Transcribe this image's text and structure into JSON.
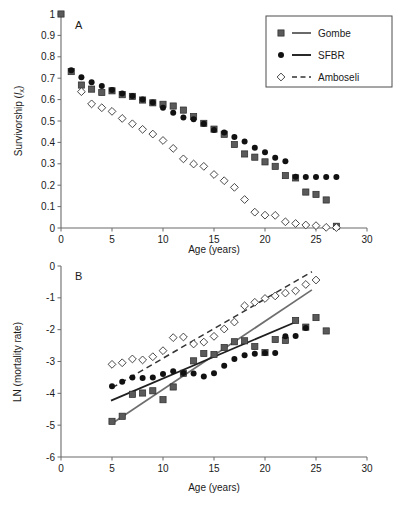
{
  "figure": {
    "background": "#ffffff",
    "panel_a_letter": "A",
    "panel_b_letter": "B"
  },
  "legend": {
    "position": "top-right of panel A",
    "border_color": "#4d4d4d",
    "entries": [
      {
        "label": "Gombe",
        "marker": "filled-square",
        "line": "solid",
        "color": "#5a5a5a"
      },
      {
        "label": "SFBR",
        "marker": "filled-circle",
        "line": "solid",
        "color": "#111111"
      },
      {
        "label": "Amboseli",
        "marker": "open-diamond",
        "line": "dashed",
        "color": "#333333"
      }
    ]
  },
  "chart_data": [
    {
      "type": "scatter",
      "panel": "A",
      "title": "",
      "xlabel": "Age (years)",
      "ylabel": "Survivorship (lx)",
      "ylabel_parts": {
        "main": "Survivorship (",
        "italic": "l",
        "sub": "x",
        "close": ")"
      },
      "xlim": [
        0,
        30
      ],
      "ylim": [
        0,
        1
      ],
      "xticks": [
        0,
        5,
        10,
        15,
        20,
        25,
        30
      ],
      "yticks": [
        0,
        0.1,
        0.2,
        0.3,
        0.4,
        0.5,
        0.6,
        0.7,
        0.8,
        0.9,
        1
      ],
      "ytick_labels": [
        "0",
        "0.1",
        "0.2",
        "0.3",
        "0.4",
        "0.5",
        "0.6",
        "0.7",
        "0.8",
        "0.9",
        "1"
      ],
      "grid": false,
      "legend_position": "upper right",
      "series": [
        {
          "name": "Gombe",
          "marker": "filled-square",
          "color": "#5a5a5a",
          "x": [
            0,
            1,
            2,
            3,
            4,
            5,
            6,
            7,
            8,
            9,
            10,
            11,
            12,
            13,
            14,
            15,
            16,
            17,
            18,
            19,
            20,
            21,
            22,
            23,
            24,
            25,
            26,
            27
          ],
          "values": [
            1.0,
            0.731,
            0.668,
            0.649,
            0.633,
            0.641,
            0.623,
            0.615,
            0.598,
            0.585,
            0.578,
            0.57,
            0.551,
            0.521,
            0.489,
            0.462,
            0.438,
            0.39,
            0.346,
            0.331,
            0.309,
            0.288,
            0.245,
            0.234,
            0.168,
            0.157,
            0.131,
            0.008
          ]
        },
        {
          "name": "SFBR",
          "marker": "filled-circle",
          "color": "#111111",
          "x": [
            1,
            2,
            3,
            4,
            5,
            6,
            7,
            8,
            9,
            10,
            11,
            12,
            13,
            14,
            15,
            16,
            17,
            18,
            19,
            20,
            21,
            22,
            23,
            24,
            25,
            26,
            27
          ],
          "values": [
            0.737,
            0.705,
            0.681,
            0.664,
            0.645,
            0.628,
            0.617,
            0.6,
            0.587,
            0.562,
            0.538,
            0.516,
            0.508,
            0.487,
            0.458,
            0.446,
            0.425,
            0.404,
            0.375,
            0.354,
            0.328,
            0.312,
            0.239,
            0.238,
            0.238,
            0.238,
            0.238
          ]
        },
        {
          "name": "Amboseli",
          "marker": "open-diamond",
          "color": "#333333",
          "x": [
            2,
            3,
            4,
            5,
            6,
            7,
            8,
            9,
            10,
            11,
            12,
            13,
            14,
            15,
            16,
            17,
            18,
            19,
            20,
            21,
            22,
            23,
            24,
            25,
            26,
            27
          ],
          "values": [
            0.637,
            0.58,
            0.562,
            0.545,
            0.512,
            0.487,
            0.461,
            0.439,
            0.409,
            0.372,
            0.323,
            0.299,
            0.288,
            0.25,
            0.221,
            0.19,
            0.133,
            0.074,
            0.06,
            0.059,
            0.029,
            0.021,
            0.014,
            0.011,
            0.003,
            0.002
          ]
        }
      ]
    },
    {
      "type": "scatter",
      "panel": "B",
      "title": "",
      "xlabel": "Age (years)",
      "ylabel": "LN (mortality rate)",
      "xlim": [
        0,
        30
      ],
      "ylim": [
        -6,
        0
      ],
      "xticks": [
        0,
        5,
        10,
        15,
        20,
        25,
        30
      ],
      "yticks": [
        0,
        -1,
        -2,
        -3,
        -4,
        -5,
        -6
      ],
      "ytick_labels": [
        "0",
        "-1",
        "-2",
        "-3",
        "-4",
        "-5",
        "-6"
      ],
      "grid": false,
      "series": [
        {
          "name": "Gombe",
          "marker": "filled-square",
          "color": "#5a5a5a",
          "x": [
            5,
            6,
            7,
            8,
            9,
            10,
            11,
            12,
            13,
            14,
            15,
            16,
            17,
            18,
            19,
            20,
            21,
            22,
            23,
            24,
            25,
            26
          ],
          "values": [
            -4.88,
            -4.72,
            -4.03,
            -3.99,
            -3.92,
            -4.2,
            -3.8,
            -3.37,
            -2.98,
            -2.75,
            -2.78,
            -2.56,
            -2.38,
            -2.35,
            -2.53,
            -2.72,
            -2.31,
            -2.34,
            -1.71,
            -1.92,
            -1.62,
            -2.04
          ]
        },
        {
          "name": "SFBR",
          "marker": "filled-circle",
          "color": "#111111",
          "x": [
            5,
            6,
            7,
            8,
            9,
            10,
            11,
            12,
            13,
            14,
            15,
            16,
            17,
            18,
            19,
            20,
            21,
            22,
            23,
            24
          ],
          "values": [
            -3.78,
            -3.64,
            -3.5,
            -3.52,
            -3.5,
            -3.39,
            -3.31,
            -3.36,
            -3.38,
            -3.47,
            -3.37,
            -3.13,
            -2.92,
            -2.8,
            -2.76,
            -2.73,
            -2.73,
            -2.21,
            -2.2,
            -1.95
          ]
        },
        {
          "name": "Amboseli",
          "marker": "open-diamond",
          "color": "#333333",
          "x": [
            5,
            6,
            7,
            8,
            9,
            10,
            11,
            12,
            13,
            14,
            15,
            16,
            17,
            18,
            19,
            20,
            21,
            22,
            23,
            24,
            25
          ],
          "values": [
            -3.09,
            -3.04,
            -2.92,
            -2.95,
            -2.85,
            -2.66,
            -2.25,
            -2.23,
            -2.45,
            -2.39,
            -2.21,
            -1.98,
            -1.76,
            -1.25,
            -1.14,
            -1.02,
            -0.94,
            -0.85,
            -0.78,
            -0.58,
            -0.44
          ]
        }
      ],
      "fit_lines": [
        {
          "name": "Gombe fit",
          "style": "solid",
          "color": "#6e6e6e",
          "x": [
            5,
            24.6
          ],
          "y": [
            -4.95,
            -0.75
          ]
        },
        {
          "name": "SFBR fit",
          "style": "solid",
          "color": "#1f1f1f",
          "x": [
            4.9,
            23.3
          ],
          "y": [
            -4.23,
            -1.72
          ]
        },
        {
          "name": "Amboseli fit",
          "style": "dashed",
          "color": "#333333",
          "x": [
            5,
            24.6
          ],
          "y": [
            -3.83,
            -0.18
          ]
        }
      ]
    }
  ]
}
